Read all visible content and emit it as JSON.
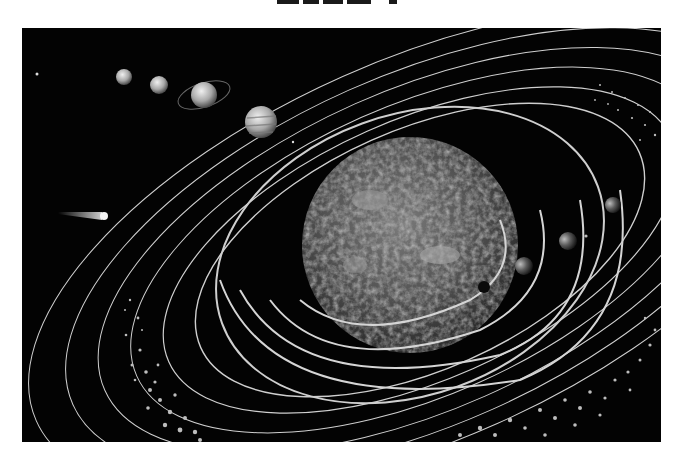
{
  "figure": {
    "background_color": "#030303",
    "page_color": "#ffffff",
    "orbit_color": "#cfcfcf",
    "sun": {
      "label": "sun",
      "cx": 410,
      "cy": 245,
      "r": 108
    },
    "planets": [
      {
        "name": "planet-1",
        "cx": 124,
        "cy": 77,
        "r": 8
      },
      {
        "name": "planet-2",
        "cx": 159,
        "cy": 85,
        "r": 9
      },
      {
        "name": "ringed-planet",
        "cx": 204,
        "cy": 95,
        "r": 13
      },
      {
        "name": "banded-planet",
        "cx": 261,
        "cy": 122,
        "r": 16
      },
      {
        "name": "inner-planet-1",
        "cx": 484,
        "cy": 287,
        "r": 6
      },
      {
        "name": "inner-planet-2",
        "cx": 524,
        "cy": 266,
        "r": 9
      },
      {
        "name": "inner-planet-3",
        "cx": 568,
        "cy": 241,
        "r": 9
      },
      {
        "name": "inner-planet-4",
        "cx": 613,
        "cy": 205,
        "r": 8
      }
    ],
    "comet": {
      "head_x": 106,
      "head_y": 216,
      "tail_x": 58,
      "tail_y": 212
    }
  }
}
